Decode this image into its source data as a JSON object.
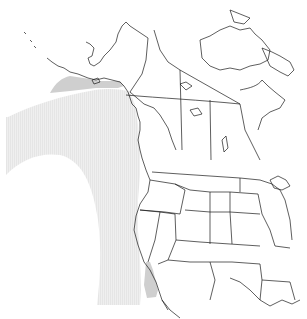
{
  "map": {
    "type": "species-range-map",
    "region": "Western North America",
    "background_color": "#ffffff",
    "outline_color": "#1a1a1a",
    "ranges": [
      {
        "name": "non-breeding-range",
        "color": "#eeeeee",
        "pattern": "vertical-hatch"
      },
      {
        "name": "year-round-range",
        "color": "#cfcfcf",
        "pattern": "solid"
      }
    ]
  }
}
